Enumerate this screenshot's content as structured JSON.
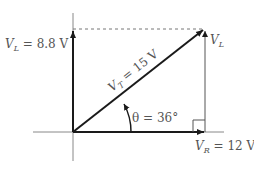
{
  "diagram": {
    "labels": {
      "vl_left": "8.8 V",
      "vl_left_prefix": "V",
      "vl_left_sub": "L",
      "vl_left_eq": " = ",
      "vl_right_prefix": "V",
      "vl_right_sub": "L",
      "vt_prefix": "V",
      "vt_sub": "T",
      "vt_value": " = 15 V",
      "theta": "θ = 36°",
      "vr_prefix": "V",
      "vr_sub": "R",
      "vr_value": " = 12 V"
    },
    "values": {
      "V_L": 8.8,
      "V_T": 15,
      "V_R": 12,
      "theta_deg": 36,
      "unit": "V"
    },
    "colors": {
      "vector": "#1a1a1a",
      "axis": "#888888",
      "text": "#555555",
      "dashed": "#777777"
    }
  }
}
